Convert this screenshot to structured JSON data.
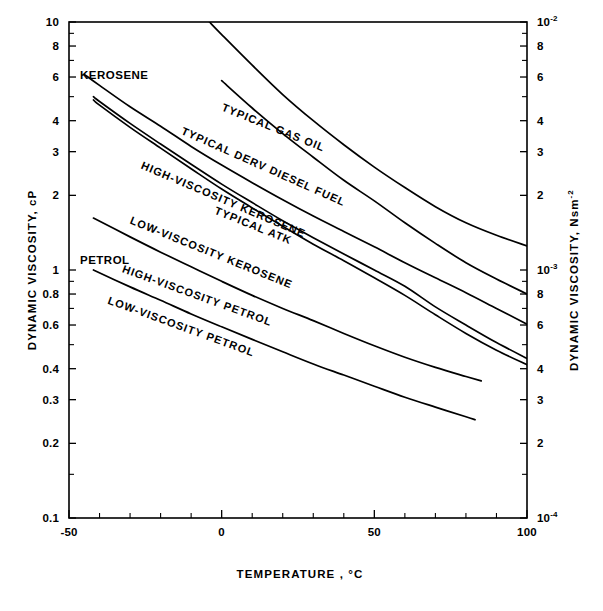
{
  "chart_data": {
    "type": "line",
    "title": "",
    "xlabel": "TEMPERATURE ,  °C",
    "xlabel_main": "TEMPERATURE ,",
    "xlabel_unit": "°C",
    "ylabel": "DYNAMIC  VISCOSITY,   cP",
    "ylabel_right": "DYNAMIC  VISCOSITY,  Nsm",
    "ylabel_right_exp": "-2",
    "xlim": [
      -50,
      100
    ],
    "ylim": [
      0.1,
      10
    ],
    "yscale": "log",
    "xscale": "linear",
    "grid": false,
    "legend_position": "inline-curve-labels",
    "x_ticks_major": [
      -50,
      0,
      50,
      100
    ],
    "x_tick_labels": [
      "-50",
      "0",
      "50",
      "100"
    ],
    "x_ticks_minor": [
      -40,
      -30,
      -20,
      -10,
      10,
      20,
      30,
      40,
      60,
      70,
      80,
      90
    ],
    "y_ticks_left": [
      10,
      8,
      6,
      4,
      3,
      2,
      1,
      0.8,
      0.6,
      0.4,
      0.3,
      0.2,
      0.1
    ],
    "y_tick_labels_left": [
      "10",
      "8",
      "6",
      "4",
      "3",
      "2",
      "1",
      "0.8",
      "0.6",
      "0.4",
      "0.3",
      "0.2",
      "0.1"
    ],
    "y_ticks_left_minor": [
      9,
      7,
      5,
      0.9,
      0.7,
      0.5,
      0.15
    ],
    "y_ticks_right": [
      10,
      8,
      6,
      4,
      3,
      2,
      1,
      0.8,
      0.6,
      0.4,
      0.3,
      0.2,
      0.1
    ],
    "y_tick_labels_right": [
      "10-2",
      "8",
      "6",
      "4",
      "3",
      "2",
      "10-3",
      "8",
      "6",
      "4",
      "3",
      "2",
      "10-4"
    ],
    "y_tick_labels_right_display": [
      {
        "base": "10",
        "exp": "-2"
      },
      {
        "base": "8",
        "exp": ""
      },
      {
        "base": "6",
        "exp": ""
      },
      {
        "base": "4",
        "exp": ""
      },
      {
        "base": "3",
        "exp": ""
      },
      {
        "base": "2",
        "exp": ""
      },
      {
        "base": "10",
        "exp": "-3"
      },
      {
        "base": "8",
        "exp": ""
      },
      {
        "base": "6",
        "exp": ""
      },
      {
        "base": "4",
        "exp": ""
      },
      {
        "base": "3",
        "exp": ""
      },
      {
        "base": "2",
        "exp": ""
      },
      {
        "base": "10",
        "exp": "-4"
      }
    ],
    "y_ticks_right_minor": [
      9,
      7,
      5,
      0.9,
      0.7,
      0.5,
      0.15
    ],
    "group_annotations": [
      {
        "name": "kerosene-group-label",
        "text": "KEROSENE",
        "x_px": 80,
        "y_px": 79
      },
      {
        "name": "petrol-group-label",
        "text": "PETROL",
        "x_px": 80,
        "y_px": 264
      }
    ],
    "series": [
      {
        "name": "TYPICAL GAS OIL",
        "label": "TYPICAL  GAS  OIL",
        "label_anchor_px": {
          "x": 272,
          "y": 131,
          "rotate": 22
        },
        "points": [
          [
            -4,
            10.0
          ],
          [
            0,
            8.9
          ],
          [
            10,
            6.7
          ],
          [
            20,
            5.1
          ],
          [
            30,
            4.0
          ],
          [
            40,
            3.2
          ],
          [
            50,
            2.6
          ],
          [
            60,
            2.15
          ],
          [
            70,
            1.8
          ],
          [
            80,
            1.55
          ],
          [
            90,
            1.38
          ],
          [
            100,
            1.25
          ]
        ]
      },
      {
        "name": "TYPICAL DERV DIESEL FUEL",
        "label": "TYPICAL  DERV  DIESEL  FUEL",
        "label_anchor_px": {
          "x": 262,
          "y": 170,
          "rotate": 24
        },
        "points": [
          [
            0,
            5.8
          ],
          [
            10,
            4.5
          ],
          [
            20,
            3.55
          ],
          [
            30,
            2.85
          ],
          [
            40,
            2.3
          ],
          [
            50,
            1.9
          ],
          [
            60,
            1.55
          ],
          [
            70,
            1.28
          ],
          [
            80,
            1.07
          ],
          [
            90,
            0.92
          ],
          [
            100,
            0.8
          ]
        ]
      },
      {
        "name": "HIGH-VISCOSITY KEROSENE",
        "label": "HIGH-VISCOSITY  KEROSENE",
        "label_anchor_px": {
          "x": 222,
          "y": 203,
          "rotate": 23
        },
        "points": [
          [
            -45,
            6.15
          ],
          [
            -40,
            5.55
          ],
          [
            -30,
            4.55
          ],
          [
            -20,
            3.8
          ],
          [
            -10,
            3.15
          ],
          [
            0,
            2.65
          ],
          [
            10,
            2.25
          ],
          [
            20,
            1.92
          ],
          [
            30,
            1.65
          ],
          [
            40,
            1.43
          ],
          [
            50,
            1.24
          ],
          [
            60,
            1.07
          ],
          [
            70,
            0.93
          ],
          [
            80,
            0.81
          ],
          [
            90,
            0.7
          ],
          [
            100,
            0.605
          ]
        ]
      },
      {
        "name": "TYPICAL ATK",
        "label": "TYPICAL   ATK",
        "label_anchor_px": {
          "x": 252,
          "y": 229,
          "rotate": 22
        },
        "points": [
          [
            -42,
            5.0
          ],
          [
            -40,
            4.78
          ],
          [
            -30,
            3.9
          ],
          [
            -20,
            3.22
          ],
          [
            -10,
            2.67
          ],
          [
            0,
            2.22
          ],
          [
            10,
            1.87
          ],
          [
            20,
            1.58
          ],
          [
            30,
            1.35
          ],
          [
            40,
            1.16
          ],
          [
            50,
            1.0
          ],
          [
            60,
            0.86
          ],
          [
            70,
            0.71
          ],
          [
            80,
            0.6
          ],
          [
            90,
            0.51
          ],
          [
            100,
            0.44
          ]
        ]
      },
      {
        "name": "LOW-VISCOSITY KEROSENE",
        "label": "LOW-VISCOSITY  KEROSENE",
        "label_anchor_px": {
          "x": 210,
          "y": 256,
          "rotate": 22
        },
        "points": [
          [
            -42,
            4.85
          ],
          [
            -40,
            4.62
          ],
          [
            -30,
            3.76
          ],
          [
            -20,
            3.1
          ],
          [
            -10,
            2.56
          ],
          [
            0,
            2.12
          ],
          [
            10,
            1.78
          ],
          [
            20,
            1.5
          ],
          [
            30,
            1.27
          ],
          [
            40,
            1.09
          ],
          [
            50,
            0.93
          ],
          [
            60,
            0.79
          ],
          [
            70,
            0.66
          ],
          [
            80,
            0.555
          ],
          [
            90,
            0.475
          ],
          [
            100,
            0.415
          ]
        ]
      },
      {
        "name": "HIGH-VISCOSITY PETROL",
        "label": "HIGH-VISCOSITY  PETROL",
        "label_anchor_px": {
          "x": 196,
          "y": 299,
          "rotate": 20
        },
        "points": [
          [
            -42,
            1.62
          ],
          [
            -30,
            1.36
          ],
          [
            -20,
            1.18
          ],
          [
            -10,
            1.03
          ],
          [
            0,
            0.9
          ],
          [
            10,
            0.79
          ],
          [
            20,
            0.7
          ],
          [
            30,
            0.625
          ],
          [
            40,
            0.555
          ],
          [
            50,
            0.495
          ],
          [
            60,
            0.445
          ],
          [
            70,
            0.405
          ],
          [
            80,
            0.372
          ],
          [
            85,
            0.357
          ]
        ]
      },
      {
        "name": "LOW-VISCOSITY PETROL",
        "label": "LOW-VISCOSITY  PETROL",
        "label_anchor_px": {
          "x": 180,
          "y": 330,
          "rotate": 20
        },
        "points": [
          [
            -42,
            1.0
          ],
          [
            -30,
            0.855
          ],
          [
            -20,
            0.755
          ],
          [
            -10,
            0.665
          ],
          [
            0,
            0.59
          ],
          [
            10,
            0.525
          ],
          [
            20,
            0.468
          ],
          [
            30,
            0.418
          ],
          [
            40,
            0.377
          ],
          [
            50,
            0.34
          ],
          [
            60,
            0.307
          ],
          [
            70,
            0.28
          ],
          [
            80,
            0.256
          ],
          [
            83,
            0.249
          ]
        ]
      }
    ]
  },
  "colors": {
    "ink": "#000000",
    "paper": "#ffffff"
  }
}
